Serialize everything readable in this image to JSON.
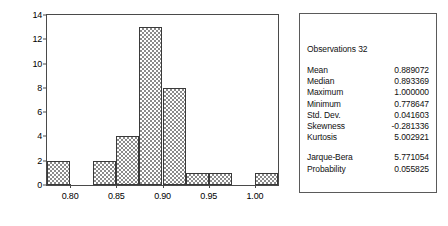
{
  "chart_data": {
    "type": "bar",
    "title": "",
    "xlabel": "",
    "ylabel": "",
    "grid": false,
    "legend": "none",
    "bin_width": 0.025,
    "categories": [
      "0.775-0.800",
      "0.800-0.825",
      "0.825-0.850",
      "0.850-0.875",
      "0.875-0.900",
      "0.900-0.925",
      "0.925-0.950",
      "0.950-0.975",
      "0.975-1.000",
      "1.000-1.025"
    ],
    "values": [
      2,
      0,
      2,
      4,
      13,
      8,
      1,
      1,
      0,
      1
    ],
    "bin_edges": [
      0.775,
      0.8,
      0.825,
      0.85,
      0.875,
      0.9,
      0.925,
      0.95,
      0.975,
      1.0,
      1.025
    ],
    "xlim": [
      0.775,
      1.025
    ],
    "ylim": [
      0,
      14
    ],
    "yticks": [
      "0",
      "2",
      "4",
      "6",
      "8",
      "10",
      "12",
      "14"
    ],
    "ytick_values": [
      0,
      2,
      4,
      6,
      8,
      10,
      12,
      14
    ],
    "xticks": [
      "0.80",
      "0.85",
      "0.90",
      "0.95",
      "1.00"
    ],
    "xtick_values": [
      0.8,
      0.85,
      0.9,
      0.95,
      1.0
    ]
  },
  "stats": {
    "observations_label": "Observations 32",
    "rows": [
      {
        "key": "Mean",
        "value": "0.889072"
      },
      {
        "key": "Median",
        "value": "0.893369"
      },
      {
        "key": "Maximum",
        "value": "1.000000"
      },
      {
        "key": "Minimum",
        "value": "0.778647"
      },
      {
        "key": "Std. Dev.",
        "value": "0.041603"
      },
      {
        "key": "Skewness",
        "value": "-0.281336"
      },
      {
        "key": "Kurtosis",
        "value": "5.002921"
      }
    ],
    "test_rows": [
      {
        "key": "Jarque-Bera",
        "value": "5.771054"
      },
      {
        "key": "Probability",
        "value": "0.055825"
      }
    ]
  }
}
